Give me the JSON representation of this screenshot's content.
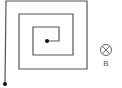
{
  "diagram": {
    "type": "square-spiral-coil-in-magnetic-field",
    "coil": {
      "path_points": [
        [
          5,
          84
        ],
        [
          6,
          1
        ],
        [
          87,
          1
        ],
        [
          87,
          69
        ],
        [
          19,
          69
        ],
        [
          19,
          14
        ],
        [
          73,
          14
        ],
        [
          73,
          55
        ],
        [
          33,
          55
        ],
        [
          33,
          27
        ],
        [
          59,
          27
        ],
        [
          59,
          41
        ],
        [
          47,
          41
        ]
      ],
      "stroke_color": "#555555",
      "terminal_dots": [
        {
          "name": "outer-terminal",
          "x": 5,
          "y": 84
        },
        {
          "name": "inner-terminal",
          "x": 47,
          "y": 41
        }
      ]
    },
    "field_symbol": {
      "meaning": "magnetic field into page",
      "glyph": "circle-with-x",
      "cx": 106,
      "cy": 50,
      "r": 5
    },
    "field_label": "B"
  }
}
